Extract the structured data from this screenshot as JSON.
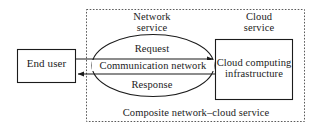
{
  "diagram": {
    "colors": {
      "stroke": "#1b1b1b",
      "dashed_boundary": "#5a5a5a",
      "background": "#ffffff",
      "text": "#1b1b1b"
    },
    "nodes": {
      "end_user": {
        "label": "End user",
        "shape": "rectangle"
      },
      "communication_network": {
        "label": "Communication network",
        "shape": "ellipse"
      },
      "cloud_infrastructure": {
        "label_line1": "Cloud computing",
        "label_line2": "infrastructure",
        "shape": "rectangle"
      }
    },
    "annotations": {
      "network_service_line1": "Network",
      "network_service_line2": "service",
      "cloud_service_line1": "Cloud",
      "cloud_service_line2": "service",
      "request": "Request",
      "response": "Response",
      "caption": "Composite network–cloud service"
    },
    "flows": [
      {
        "name": "request-arrow",
        "label": "Request",
        "from": "end_user",
        "to": "cloud_infrastructure",
        "direction": "right"
      },
      {
        "name": "response-arrow",
        "label": "Response",
        "from": "cloud_infrastructure",
        "to": "end_user",
        "direction": "left"
      }
    ],
    "boundary": {
      "name": "composite-service-boundary",
      "style": "dashed"
    }
  }
}
